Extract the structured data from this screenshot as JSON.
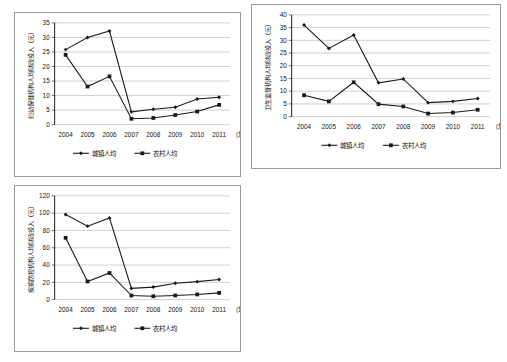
{
  "figure": {
    "layout": "2x2 grid, fourth cell empty",
    "panel_count": 3
  },
  "common": {
    "legend": [
      {
        "key": "urban",
        "label": "城镇人均",
        "marker": "diamond"
      },
      {
        "key": "rural",
        "label": "农村人均",
        "marker": "square"
      }
    ],
    "x_axis_suffix": "（年）",
    "categories": [
      "2004",
      "2005",
      "2006",
      "2007",
      "2008",
      "2009",
      "2010",
      "2011"
    ],
    "line_color": "#1a1a1a",
    "grid_color": "#b9b9b9",
    "border_color": "#9a9a9a"
  },
  "chart_data": [
    {
      "id": "chart-maternal-child-health",
      "type": "line",
      "title": "",
      "xlabel": "（年）",
      "ylabel": "妇幼保健机构人均财政投入（元）",
      "categories": [
        "2004",
        "2005",
        "2006",
        "2007",
        "2008",
        "2009",
        "2010",
        "2011"
      ],
      "ylim": [
        0,
        35
      ],
      "yticks": [
        0,
        5,
        10,
        15,
        20,
        25,
        30,
        35
      ],
      "grid": true,
      "legend_position": "bottom",
      "series": [
        {
          "name": "城镇人均",
          "marker": "diamond",
          "values": [
            25.8,
            30.0,
            32.2,
            4.4,
            5.3,
            6.0,
            8.8,
            9.4
          ]
        },
        {
          "name": "农村人均",
          "marker": "square",
          "values": [
            24.0,
            13.1,
            16.6,
            2.0,
            2.3,
            3.3,
            4.5,
            6.8
          ]
        }
      ]
    },
    {
      "id": "chart-health-supervision",
      "type": "line",
      "title": "",
      "xlabel": "（年）",
      "ylabel": "卫生监督机构人均财政投入（元）",
      "categories": [
        "2004",
        "2005",
        "2006",
        "2007",
        "2008",
        "2009",
        "2010",
        "2011"
      ],
      "ylim": [
        0,
        40
      ],
      "yticks": [
        0,
        5,
        10,
        15,
        20,
        25,
        30,
        35,
        40
      ],
      "grid": true,
      "legend_position": "bottom",
      "series": [
        {
          "name": "城镇人均",
          "marker": "diamond",
          "values": [
            36.0,
            26.8,
            32.1,
            13.3,
            14.8,
            5.5,
            6.0,
            7.1
          ]
        },
        {
          "name": "农村人均",
          "marker": "square",
          "values": [
            8.4,
            6.0,
            13.5,
            4.9,
            4.0,
            1.2,
            1.6,
            2.7
          ]
        }
      ]
    },
    {
      "id": "chart-disease-control",
      "type": "line",
      "title": "",
      "xlabel": "（年）",
      "ylabel": "疾病防控机构人均财政投入（元）",
      "categories": [
        "2004",
        "2005",
        "2006",
        "2007",
        "2008",
        "2009",
        "2010",
        "2011"
      ],
      "ylim": [
        0,
        120
      ],
      "yticks": [
        0,
        20,
        40,
        60,
        80,
        100,
        120
      ],
      "grid": true,
      "legend_position": "bottom",
      "series": [
        {
          "name": "城镇人均",
          "marker": "diamond",
          "values": [
            98.5,
            85.0,
            94.5,
            13.0,
            14.5,
            19.0,
            20.8,
            23.3
          ]
        },
        {
          "name": "农村人均",
          "marker": "square",
          "values": [
            71.5,
            21.0,
            30.8,
            4.7,
            3.9,
            4.8,
            6.0,
            7.8
          ]
        }
      ]
    }
  ]
}
